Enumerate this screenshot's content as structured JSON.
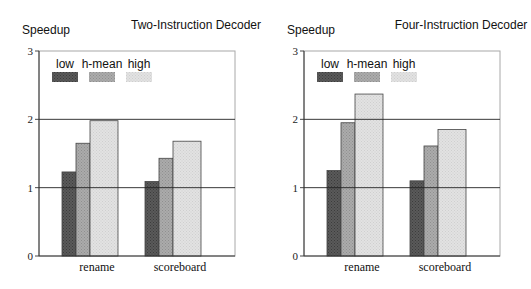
{
  "chart_data": [
    {
      "type": "bar",
      "title": "Two-Instruction Decoder",
      "xlabel": "",
      "ylabel": "Speedup",
      "ylim": [
        0,
        3
      ],
      "yticks": [
        0,
        1,
        2,
        3
      ],
      "grid": "horizontal lines at 1 and 2",
      "legend_position": "top-left inside",
      "categories": [
        "rename",
        "scoreboard"
      ],
      "series": [
        {
          "name": "low",
          "values": [
            1.23,
            1.09
          ],
          "color": "#5a5a5a"
        },
        {
          "name": "h-mean",
          "values": [
            1.65,
            1.43
          ],
          "color": "#ababab"
        },
        {
          "name": "high",
          "values": [
            1.98,
            1.68
          ],
          "color": "#e2e2e2"
        }
      ]
    },
    {
      "type": "bar",
      "title": "Four-Instruction Decoder",
      "xlabel": "",
      "ylabel": "Speedup",
      "ylim": [
        0,
        3
      ],
      "yticks": [
        0,
        1,
        2,
        3
      ],
      "grid": "horizontal lines at 1 and 2",
      "legend_position": "top-left inside",
      "categories": [
        "rename",
        "scoreboard"
      ],
      "series": [
        {
          "name": "low",
          "values": [
            1.25,
            1.1
          ],
          "color": "#5a5a5a"
        },
        {
          "name": "h-mean",
          "values": [
            1.95,
            1.61
          ],
          "color": "#ababab"
        },
        {
          "name": "high",
          "values": [
            2.37,
            1.85
          ],
          "color": "#e2e2e2"
        }
      ]
    }
  ]
}
